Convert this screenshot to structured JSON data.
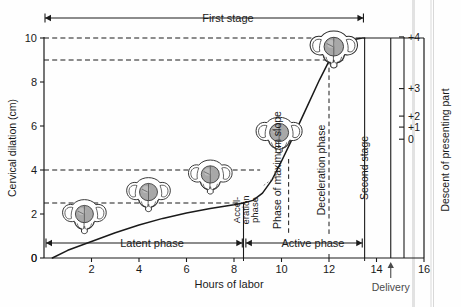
{
  "figure": {
    "background": "#fefefe",
    "ink": "#1a1a1a"
  },
  "axes": {
    "left": {
      "label": "Cervical dilation (cm)",
      "ticks": [
        "0",
        "2",
        "4",
        "6",
        "8",
        "10"
      ],
      "tick_values": [
        0,
        2,
        4,
        6,
        8,
        10
      ],
      "range": [
        0,
        10.4
      ]
    },
    "bottom": {
      "label": "Hours of labor",
      "ticks": [
        "0",
        "2",
        "4",
        "6",
        "8",
        "10",
        "12",
        "14",
        "16"
      ],
      "tick_values": [
        0,
        2,
        4,
        6,
        8,
        10,
        12,
        14,
        16
      ],
      "range": [
        0,
        16
      ]
    },
    "right": {
      "label": "Descent of presenting part",
      "ticks": [
        "+4",
        "+3",
        "+2",
        "+1",
        "0"
      ],
      "tick_values": [
        4,
        3,
        2,
        1,
        0
      ],
      "tick_y_cm": [
        10.05,
        7.7,
        6.45,
        5.95,
        5.4
      ]
    }
  },
  "annotations": {
    "first_stage": "First stage",
    "second_stage": "Second stage",
    "latent_phase": "Latent phase",
    "active_phase": "Active phase",
    "acceleration_phase_line1": "Accel-",
    "acceleration_phase_line2": "eration",
    "acceleration_phase_line3": "phase",
    "max_slope_phase": "Phase of maximum slope",
    "deceleration_phase": "Deceleration phase",
    "delivery": "Delivery"
  },
  "chart_data": {
    "type": "line",
    "xlabel": "Hours of labor",
    "ylabel": "Cervical dilation (cm)",
    "y2label": "Descent of presenting part",
    "xlim": [
      0,
      16
    ],
    "ylim": [
      0,
      10.4
    ],
    "grid": false,
    "legend_position": "none",
    "series": [
      {
        "name": "Cervical dilation",
        "points": [
          [
            0.35,
            0.0
          ],
          [
            1.0,
            0.35
          ],
          [
            2.0,
            0.75
          ],
          [
            3.0,
            1.15
          ],
          [
            4.0,
            1.5
          ],
          [
            5.0,
            1.8
          ],
          [
            6.0,
            2.05
          ],
          [
            7.0,
            2.25
          ],
          [
            8.0,
            2.42
          ],
          [
            8.4,
            2.5
          ],
          [
            8.8,
            2.62
          ],
          [
            9.2,
            2.95
          ],
          [
            9.6,
            3.55
          ],
          [
            10.0,
            4.4
          ],
          [
            10.4,
            5.3
          ],
          [
            11.0,
            6.7
          ],
          [
            11.6,
            8.1
          ],
          [
            12.0,
            8.95
          ],
          [
            12.4,
            9.55
          ],
          [
            12.9,
            9.9
          ],
          [
            13.4,
            10.0
          ],
          [
            13.5,
            10.0
          ]
        ]
      }
    ],
    "dashed_reference_lines": {
      "horizontal_cm": [
        2.5,
        4.0,
        9.0,
        10.0
      ],
      "vertical_hours": [
        10.3,
        12.0
      ]
    },
    "phase_boundaries_hours": {
      "latent_start": 0.35,
      "latent_end": 8.4,
      "acceleration_start": 8.4,
      "acceleration_end": 10.3,
      "max_slope_start": 10.3,
      "max_slope_end": 12.0,
      "deceleration_start": 12.0,
      "deceleration_end": 13.5,
      "first_stage_end": 13.5,
      "second_stage_start": 13.5,
      "second_stage_end": 14.6,
      "delivery_hour": 14.6
    },
    "pelvis_stations": [
      {
        "hour": 1.7,
        "dilation_cm": 1.9,
        "station": 0
      },
      {
        "hour": 4.4,
        "dilation_cm": 2.9,
        "station": 1
      },
      {
        "hour": 7.0,
        "dilation_cm": 3.7,
        "station": 2
      },
      {
        "hour": 9.9,
        "dilation_cm": 5.6,
        "station": 3
      },
      {
        "hour": 12.2,
        "dilation_cm": 9.5,
        "station": 4
      }
    ]
  }
}
